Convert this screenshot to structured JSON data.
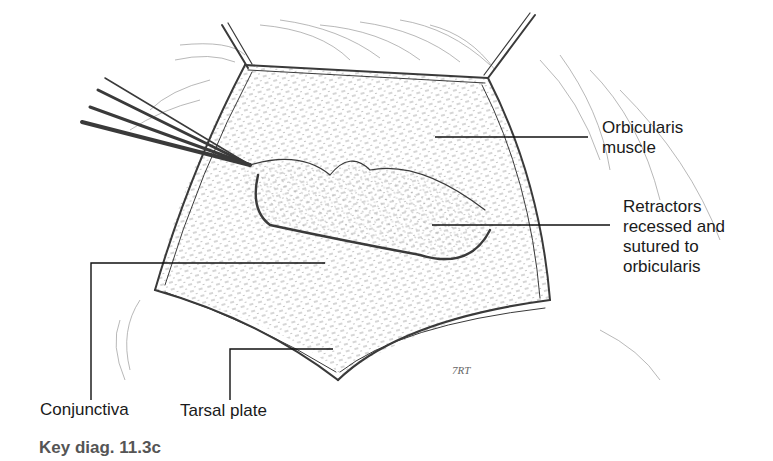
{
  "figure": {
    "caption": "Key diag. 11.3c",
    "signature": "7RT",
    "labels": {
      "orbicularis": "Orbicularis\nmuscle",
      "retractors": "Retractors\nrecessed and\nsutured to\norbicularis",
      "conjunctiva": "Conjunctiva",
      "tarsal_plate": "Tarsal plate"
    }
  }
}
